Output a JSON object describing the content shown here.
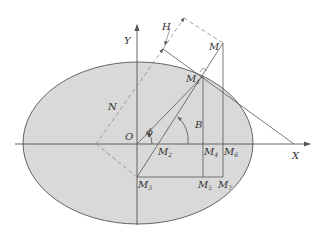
{
  "diagram": {
    "type": "ellipsoid-geometry",
    "colors": {
      "ellipse_fill": "#d9d9d9",
      "line": "#555555",
      "dashed": "#888888",
      "background": "#ffffff"
    },
    "labels": {
      "X": "X",
      "Y": "Y",
      "O": "O",
      "M": "M",
      "H": "H",
      "N": "N",
      "B": "B",
      "phi": "ϕ",
      "M1": {
        "base": "M",
        "sub": "1"
      },
      "M2": {
        "base": "M",
        "sub": "2"
      },
      "M3": {
        "base": "M",
        "sub": "3"
      },
      "M4": {
        "base": "M",
        "sub": "4"
      },
      "M5": {
        "base": "M",
        "sub": "5"
      },
      "M6": {
        "base": "M",
        "sub": "6"
      },
      "M7": {
        "base": "M",
        "sub": "7"
      }
    }
  }
}
